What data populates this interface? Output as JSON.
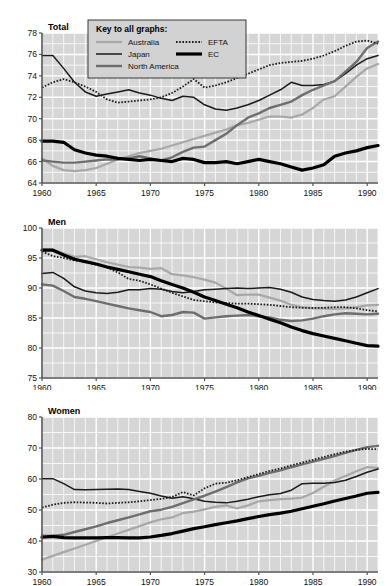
{
  "legend": {
    "title": "Key to all graphs:",
    "entries": [
      {
        "label": "Australia",
        "key": "australia",
        "color": "#a8a8a8",
        "width": 2.2,
        "dash": ""
      },
      {
        "label": "Japan",
        "key": "japan",
        "color": "#1a1a1a",
        "width": 1.5,
        "dash": ""
      },
      {
        "label": "North America",
        "key": "northamerica",
        "color": "#6e6e6e",
        "width": 2.4,
        "dash": ""
      },
      {
        "label": "EFTA",
        "key": "efta",
        "color": "#1a1a1a",
        "width": 1.8,
        "dash": "1.6,1.6"
      },
      {
        "label": "EC",
        "key": "ec",
        "color": "#000000",
        "width": 3.2,
        "dash": ""
      }
    ]
  },
  "style": {
    "plot_background": "#d6d6d6",
    "gridline_color": "#ffffff",
    "axis_color": "#555555",
    "legend_background": "#d2d2d2",
    "legend_border": "#3a3a3a",
    "page_background": "#ffffff"
  },
  "chart_data": [
    {
      "id": "total",
      "type": "line",
      "title": "Total",
      "xlabel": "",
      "ylabel": "",
      "xlim": [
        1960,
        1991
      ],
      "ylim": [
        64,
        78
      ],
      "yticks": [
        64,
        66,
        68,
        70,
        72,
        74,
        76,
        78
      ],
      "xticks": [
        1960,
        1965,
        1970,
        1975,
        1980,
        1985,
        1990
      ],
      "grid": true,
      "legend_position": "top-center-inside",
      "x": [
        1960,
        1961,
        1962,
        1963,
        1964,
        1965,
        1966,
        1967,
        1968,
        1969,
        1970,
        1971,
        1972,
        1973,
        1974,
        1975,
        1976,
        1977,
        1978,
        1979,
        1980,
        1981,
        1982,
        1983,
        1984,
        1985,
        1986,
        1987,
        1988,
        1989,
        1990,
        1991
      ],
      "series": [
        {
          "name": "Australia",
          "key": "australia",
          "values": [
            66.3,
            65.6,
            65.2,
            65.1,
            65.2,
            65.4,
            65.8,
            66.2,
            66.5,
            66.8,
            67.0,
            67.2,
            67.5,
            67.8,
            68.1,
            68.4,
            68.7,
            69.0,
            69.4,
            69.6,
            69.9,
            70.2,
            70.2,
            70.1,
            70.4,
            71.0,
            71.8,
            72.1,
            73.0,
            73.9,
            74.7,
            75.1
          ]
        },
        {
          "name": "Japan",
          "key": "japan",
          "values": [
            75.9,
            75.9,
            74.7,
            73.4,
            72.5,
            72.1,
            72.3,
            72.5,
            72.7,
            72.4,
            72.2,
            71.9,
            71.7,
            72.1,
            72.0,
            71.3,
            70.9,
            70.8,
            71.0,
            71.3,
            71.7,
            72.2,
            72.7,
            73.4,
            73.1,
            73.1,
            73.2,
            73.5,
            74.2,
            75.0,
            75.6,
            75.9
          ]
        },
        {
          "name": "North America",
          "key": "northamerica",
          "values": [
            66.1,
            66.0,
            65.9,
            65.9,
            66.0,
            66.1,
            66.2,
            66.2,
            66.3,
            66.5,
            66.3,
            66.1,
            66.4,
            66.9,
            67.3,
            67.4,
            68.0,
            68.6,
            69.4,
            70.1,
            70.5,
            71.0,
            71.3,
            71.6,
            72.2,
            72.7,
            73.1,
            73.5,
            74.4,
            75.3,
            76.6,
            77.2
          ]
        },
        {
          "name": "EFTA",
          "key": "efta",
          "values": [
            72.9,
            73.4,
            73.7,
            73.4,
            73.0,
            72.5,
            71.8,
            71.5,
            71.6,
            71.7,
            71.8,
            72.0,
            72.4,
            73.0,
            73.7,
            72.9,
            73.1,
            73.4,
            73.8,
            74.2,
            74.6,
            75.0,
            75.2,
            75.3,
            75.4,
            75.6,
            75.9,
            76.3,
            76.8,
            77.2,
            77.3,
            77.0
          ]
        },
        {
          "name": "EC",
          "key": "ec",
          "values": [
            67.9,
            67.9,
            67.8,
            67.1,
            66.8,
            66.6,
            66.5,
            66.3,
            66.2,
            66.1,
            66.2,
            66.1,
            66.0,
            66.3,
            66.2,
            65.9,
            65.9,
            66.0,
            65.8,
            66.0,
            66.2,
            66.0,
            65.8,
            65.5,
            65.2,
            65.4,
            65.7,
            66.5,
            66.8,
            67.0,
            67.3,
            67.5
          ]
        }
      ]
    },
    {
      "id": "men",
      "type": "line",
      "title": "Men",
      "xlabel": "",
      "ylabel": "",
      "xlim": [
        1960,
        1991
      ],
      "ylim": [
        75,
        100
      ],
      "yticks": [
        75,
        80,
        85,
        90,
        95,
        100
      ],
      "xticks": [
        1960,
        1965,
        1970,
        1975,
        1980,
        1985,
        1990
      ],
      "grid": true,
      "legend_position": "none",
      "x": [
        1960,
        1961,
        1962,
        1963,
        1964,
        1965,
        1966,
        1967,
        1968,
        1969,
        1970,
        1971,
        1972,
        1973,
        1974,
        1975,
        1976,
        1977,
        1978,
        1979,
        1980,
        1981,
        1982,
        1983,
        1984,
        1985,
        1986,
        1987,
        1988,
        1989,
        1990,
        1991
      ],
      "series": [
        {
          "name": "Australia",
          "key": "australia",
          "values": [
            96.5,
            96.4,
            95.8,
            95.2,
            95.3,
            94.8,
            94.3,
            93.9,
            93.5,
            93.4,
            93.2,
            93.3,
            92.3,
            92.1,
            91.8,
            91.4,
            90.9,
            89.9,
            88.8,
            88.9,
            88.9,
            88.4,
            87.9,
            87.2,
            86.8,
            86.6,
            86.6,
            86.5,
            86.6,
            86.8,
            87.1,
            87.2
          ]
        },
        {
          "name": "Japan",
          "key": "japan",
          "values": [
            92.4,
            92.6,
            91.6,
            90.2,
            89.5,
            89.2,
            89.1,
            89.3,
            89.7,
            89.7,
            89.9,
            89.8,
            89.4,
            89.2,
            89.4,
            89.7,
            89.8,
            89.9,
            90.0,
            89.9,
            90.0,
            90.1,
            89.8,
            89.3,
            88.5,
            88.1,
            87.9,
            87.8,
            88.0,
            88.5,
            89.2,
            89.9
          ]
        },
        {
          "name": "North America",
          "key": "northamerica",
          "values": [
            90.6,
            90.4,
            89.5,
            88.5,
            88.2,
            87.8,
            87.4,
            87.0,
            86.6,
            86.3,
            86.0,
            85.3,
            85.5,
            86.0,
            85.9,
            84.9,
            85.1,
            85.3,
            85.4,
            85.5,
            85.3,
            85.1,
            84.7,
            84.5,
            84.6,
            84.9,
            85.3,
            85.6,
            85.8,
            85.7,
            85.6,
            85.7
          ]
        },
        {
          "name": "EFTA",
          "key": "efta",
          "values": [
            96.1,
            95.3,
            95.0,
            94.6,
            94.3,
            93.9,
            93.4,
            92.6,
            91.5,
            91.2,
            90.6,
            89.9,
            89.2,
            88.6,
            88.0,
            87.8,
            87.6,
            87.5,
            87.4,
            87.4,
            87.3,
            87.2,
            87.0,
            86.8,
            86.7,
            86.7,
            86.7,
            86.8,
            86.8,
            86.6,
            86.3,
            86.1
          ]
        },
        {
          "name": "EC",
          "key": "ec",
          "values": [
            96.3,
            96.3,
            95.5,
            94.8,
            94.4,
            94.0,
            93.5,
            93.1,
            92.7,
            92.3,
            91.9,
            91.2,
            90.6,
            90.0,
            89.3,
            88.5,
            87.9,
            87.3,
            86.7,
            86.0,
            85.4,
            84.8,
            84.2,
            83.5,
            82.9,
            82.4,
            82.0,
            81.6,
            81.2,
            80.8,
            80.4,
            80.3
          ]
        }
      ]
    },
    {
      "id": "women",
      "type": "line",
      "title": "Women",
      "xlabel": "",
      "ylabel": "",
      "xlim": [
        1960,
        1991
      ],
      "ylim": [
        30,
        80
      ],
      "yticks": [
        30,
        40,
        50,
        60,
        70,
        80
      ],
      "xticks": [
        1960,
        1965,
        1970,
        1975,
        1980,
        1985,
        1990
      ],
      "grid": true,
      "legend_position": "none",
      "x": [
        1960,
        1961,
        1962,
        1963,
        1964,
        1965,
        1966,
        1967,
        1968,
        1969,
        1970,
        1971,
        1972,
        1973,
        1974,
        1975,
        1976,
        1977,
        1978,
        1979,
        1980,
        1981,
        1982,
        1983,
        1984,
        1985,
        1986,
        1987,
        1988,
        1989,
        1990,
        1991
      ],
      "series": [
        {
          "name": "Australia",
          "key": "australia",
          "values": [
            34.0,
            35.2,
            36.4,
            37.6,
            38.8,
            40.0,
            41.2,
            42.4,
            43.6,
            44.8,
            46.0,
            47.0,
            47.6,
            49.0,
            49.5,
            50.2,
            51.0,
            51.5,
            50.5,
            51.5,
            52.8,
            53.2,
            53.5,
            53.7,
            54.0,
            55.5,
            57.5,
            59.5,
            61.0,
            62.5,
            63.8,
            63.6
          ]
        },
        {
          "name": "Japan",
          "key": "japan",
          "values": [
            60.1,
            60.1,
            58.5,
            56.6,
            56.5,
            56.6,
            56.7,
            56.8,
            56.6,
            56.0,
            55.4,
            54.5,
            53.8,
            54.3,
            53.6,
            52.8,
            52.5,
            52.3,
            52.8,
            53.5,
            54.3,
            54.9,
            55.3,
            56.4,
            58.5,
            58.6,
            58.6,
            58.9,
            59.6,
            60.8,
            62.2,
            63.2
          ]
        },
        {
          "name": "North America",
          "key": "northamerica",
          "values": [
            41.7,
            41.6,
            42.0,
            42.9,
            43.8,
            44.7,
            45.8,
            46.7,
            47.6,
            48.6,
            49.6,
            50.1,
            51.0,
            52.2,
            53.4,
            54.6,
            55.9,
            57.4,
            58.9,
            60.2,
            61.0,
            62.0,
            62.8,
            63.8,
            64.7,
            65.6,
            66.5,
            67.4,
            68.4,
            69.4,
            70.3,
            70.7
          ]
        },
        {
          "name": "EFTA",
          "key": "efta",
          "values": [
            50.8,
            51.7,
            52.3,
            52.5,
            52.4,
            52.3,
            52.1,
            52.3,
            52.5,
            52.8,
            53.2,
            53.6,
            54.2,
            55.8,
            54.7,
            57.0,
            58.5,
            58.8,
            59.6,
            60.6,
            61.6,
            62.6,
            63.4,
            64.4,
            65.3,
            66.2,
            67.1,
            68.0,
            68.8,
            69.4,
            69.7,
            69.6
          ]
        },
        {
          "name": "EC",
          "key": "ec",
          "values": [
            41.2,
            41.5,
            41.1,
            41.0,
            41.0,
            41.0,
            41.1,
            41.1,
            41.0,
            41.0,
            41.3,
            41.8,
            42.4,
            43.2,
            44.0,
            44.6,
            45.3,
            45.9,
            46.5,
            47.2,
            47.9,
            48.5,
            49.0,
            49.6,
            50.4,
            51.2,
            52.0,
            52.9,
            53.7,
            54.5,
            55.4,
            55.7
          ]
        }
      ]
    }
  ]
}
